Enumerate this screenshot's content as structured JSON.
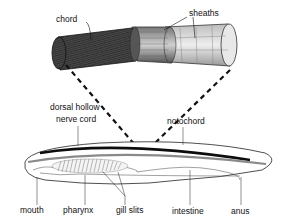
{
  "labels": {
    "chord": "chord",
    "sheaths": "sheaths",
    "dorsal_hollow": "dorsal hollow",
    "nerve_cord": "nerve cord",
    "notochord": "notochord",
    "mouth": "mouth",
    "pharynx": "pharynx",
    "gill_slits": "gill slits",
    "intestine": "intestine",
    "anus": "anus"
  },
  "colors": {
    "ink": "#111111",
    "nerve_cord": "#0d0d0d",
    "notochord": "#8a8a8a",
    "sheath_light": "#d9d9d9",
    "chord_dark": "#2a2a2a"
  }
}
